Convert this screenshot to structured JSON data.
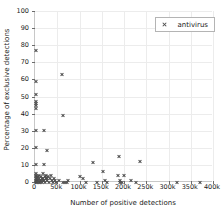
{
  "chart_data": {
    "type": "scatter",
    "title": "",
    "xlabel": "Number of positive detections",
    "ylabel": "Percentage of exclusive detections",
    "xlim": [
      0,
      400000
    ],
    "ylim": [
      0,
      100
    ],
    "grid": true,
    "legend_position": "top-right",
    "xticks": [
      0,
      50000,
      100000,
      150000,
      200000,
      250000,
      300000,
      350000,
      400000
    ],
    "xtick_labels": [
      "0",
      "50k",
      "100k",
      "150k",
      "200k",
      "250k",
      "300k",
      "350k",
      "400k"
    ],
    "yticks": [
      0,
      10,
      20,
      30,
      40,
      50,
      60,
      70,
      80,
      90,
      100
    ],
    "ytick_labels": [
      "0",
      "10",
      "20",
      "30",
      "40",
      "50",
      "60",
      "70",
      "80",
      "90",
      "100"
    ],
    "marker": "x",
    "marker_color": "#4d4d4d",
    "series": [
      {
        "name": "antivirus",
        "points": [
          [
            2000,
            77
          ],
          [
            2000,
            59
          ],
          [
            2000,
            51
          ],
          [
            2000,
            47
          ],
          [
            2000,
            46
          ],
          [
            2000,
            45
          ],
          [
            2000,
            43
          ],
          [
            2000,
            30
          ],
          [
            2000,
            20
          ],
          [
            2000,
            10
          ],
          [
            2000,
            5
          ],
          [
            2000,
            4
          ],
          [
            2000,
            3
          ],
          [
            2000,
            2
          ],
          [
            2000,
            1
          ],
          [
            2000,
            0.5
          ],
          [
            3000,
            0
          ],
          [
            4000,
            1
          ],
          [
            5000,
            2
          ],
          [
            5000,
            0
          ],
          [
            6000,
            3
          ],
          [
            7000,
            1
          ],
          [
            8000,
            0
          ],
          [
            9000,
            2
          ],
          [
            10000,
            4
          ],
          [
            11000,
            1
          ],
          [
            12000,
            0
          ],
          [
            13000,
            3
          ],
          [
            14000,
            1
          ],
          [
            15000,
            2
          ],
          [
            16000,
            0
          ],
          [
            17000,
            5
          ],
          [
            18000,
            1
          ],
          [
            19000,
            2
          ],
          [
            20000,
            30
          ],
          [
            20000,
            10
          ],
          [
            21000,
            1
          ],
          [
            22000,
            3
          ],
          [
            23000,
            0
          ],
          [
            24000,
            2
          ],
          [
            25000,
            4
          ],
          [
            26000,
            1
          ],
          [
            27000,
            18.5
          ],
          [
            28000,
            2
          ],
          [
            30000,
            3
          ],
          [
            32000,
            0
          ],
          [
            34000,
            2
          ],
          [
            36000,
            4
          ],
          [
            38000,
            1
          ],
          [
            40000,
            0
          ],
          [
            42000,
            2
          ],
          [
            45000,
            1
          ],
          [
            48000,
            0
          ],
          [
            55000,
            1
          ],
          [
            60000,
            63
          ],
          [
            62000,
            39
          ],
          [
            64000,
            0
          ],
          [
            68000,
            0
          ],
          [
            72000,
            0
          ],
          [
            75000,
            1
          ],
          [
            100000,
            3
          ],
          [
            108000,
            2
          ],
          [
            115000,
            0
          ],
          [
            130000,
            11.5
          ],
          [
            140000,
            0
          ],
          [
            152000,
            6
          ],
          [
            158000,
            1
          ],
          [
            162000,
            0
          ],
          [
            188000,
            15
          ],
          [
            186000,
            4
          ],
          [
            190000,
            1
          ],
          [
            192000,
            0
          ],
          [
            196000,
            0
          ],
          [
            200000,
            4
          ],
          [
            215000,
            1
          ],
          [
            228000,
            0
          ],
          [
            235000,
            12
          ],
          [
            320000,
            0
          ],
          [
            370000,
            0
          ]
        ]
      }
    ]
  },
  "legend": {
    "entries": [
      {
        "label": "antivirus",
        "marker": "x"
      }
    ]
  }
}
